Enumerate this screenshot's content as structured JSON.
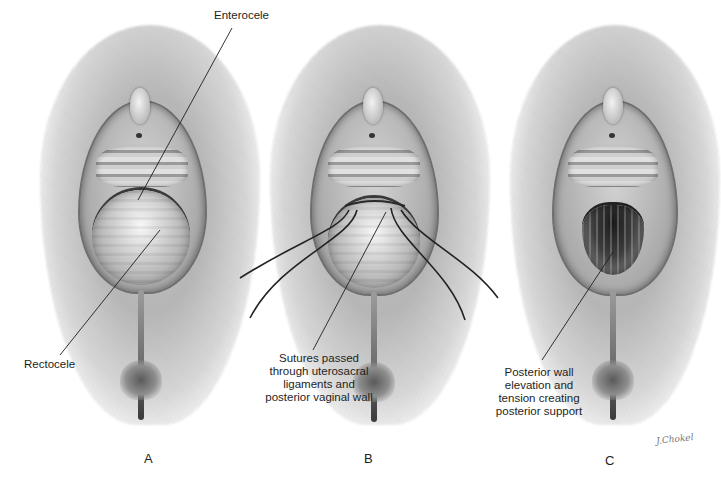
{
  "figure": {
    "panels": [
      {
        "id": "A",
        "letter": "A",
        "state": "prolapse-bulge"
      },
      {
        "id": "B",
        "letter": "B",
        "state": "sutures-placed"
      },
      {
        "id": "C",
        "letter": "C",
        "state": "repaired-open"
      }
    ],
    "labels": {
      "enterocele": "Enterocele",
      "rectocele": "Rectocele",
      "sutures": [
        "Sutures passed",
        "through uterosacral",
        "ligaments and",
        "posterior vaginal wall"
      ],
      "posterior": [
        "Posterior wall",
        "elevation and",
        "tension creating",
        "posterior support"
      ]
    },
    "signature": "J.Chokel",
    "colors": {
      "background": "#ffffff",
      "line": "#1e1e1e",
      "suture": "#222222",
      "text": "#1e1e1e"
    }
  }
}
